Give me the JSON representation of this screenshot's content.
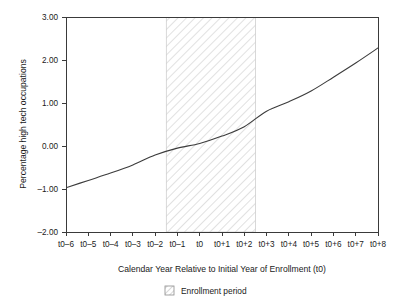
{
  "chart_data": {
    "type": "line",
    "title": "",
    "subtitle": "",
    "xlabel": "Calendar Year Relative to Initial Year of Enrollment (t0)",
    "ylabel": "Percentage high tech occupations",
    "x_tick_labels": [
      "t0–6",
      "t0–5",
      "t0–4",
      "t0–3",
      "t0–2",
      "t0–1",
      "t0",
      "t0+1",
      "t0+2",
      "t0+3",
      "t0+4",
      "t0+5",
      "t0+6",
      "t0+7",
      "t0+8"
    ],
    "y_tick_labels": [
      "3.00",
      "2.00",
      "1.00",
      "0.00",
      "–1.00",
      "–2.00"
    ],
    "y_tick_values": [
      3.0,
      2.0,
      1.0,
      0.0,
      -1.0,
      -2.0
    ],
    "ylim": [
      -2.0,
      3.0
    ],
    "xlim": [
      -6,
      8
    ],
    "grid": false,
    "legend_position": "below-axis-center",
    "legend": [
      {
        "label": "Enrollment period",
        "swatch": "hatched-square"
      }
    ],
    "series": [
      {
        "name": "Percentage high tech occupations",
        "x": [
          -6,
          -5,
          -4,
          -3,
          -2,
          -1,
          0,
          1,
          2,
          3,
          4,
          5,
          6,
          7,
          8
        ],
        "values": [
          -0.97,
          -0.8,
          -0.63,
          -0.44,
          -0.21,
          -0.05,
          0.06,
          0.23,
          0.45,
          0.81,
          1.03,
          1.28,
          1.6,
          1.93,
          2.28
        ]
      }
    ],
    "shaded_regions": [
      {
        "label": "Enrollment period",
        "x_start": -1.5,
        "x_end": 2.5,
        "style": "diagonal-hatch",
        "color": "#b5b5b5"
      }
    ]
  },
  "colors": {
    "line": "#3c3c3c",
    "axis": "#3a3a3a",
    "hatch": "#b5b5b5",
    "background": "#ffffff",
    "text": "#1a1a1a"
  }
}
